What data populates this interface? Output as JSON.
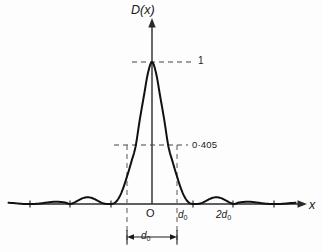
{
  "figure": {
    "background_color": "#fdfdfd",
    "curve_color": "#111111",
    "axis_color": "#2a2a2a",
    "dash_color": "#555555"
  },
  "labels": {
    "y_axis": "D(x)",
    "x_axis": "x",
    "peak_value": "1",
    "half_value": "0·405",
    "origin": "O",
    "tick_d0": "d",
    "tick_d0_sub": "0",
    "tick_2d0": "2d",
    "tick_2d0_sub": "0",
    "width_label": "d",
    "width_label_sub": "0"
  },
  "chart_data": {
    "type": "line",
    "title": "",
    "xlabel": "x",
    "ylabel": "D(x)",
    "xlim": [
      -3.5,
      3.5
    ],
    "ylim": [
      -0.08,
      1.12
    ],
    "grid": false,
    "legend": null,
    "annotations": [
      {
        "text": "1",
        "x": 0.0,
        "y": 1.0,
        "note": "peak amplitude, dashed horizontal leader to the right"
      },
      {
        "text": "0·405",
        "x": 0.0,
        "y": 0.405,
        "note": "half-power style level, dashed horizontal line crossing the main lobe"
      },
      {
        "text": "O",
        "x": 0.0,
        "y": 0.0,
        "note": "origin label below axis"
      },
      {
        "text": "d0",
        "x": 1.0,
        "y": 0.0,
        "note": "first zero tick label"
      },
      {
        "text": "2d0",
        "x": 2.0,
        "y": 0.0,
        "note": "second zero tick label"
      },
      {
        "text": "d0",
        "x": 0.0,
        "y": -0.25,
        "note": "double-headed arrow width measured between the two 0·405 crossings"
      }
    ],
    "x_ticks": [
      -3,
      -2,
      -1,
      0,
      1,
      2,
      3
    ],
    "x_tick_labels": [
      "",
      "",
      "",
      "O",
      "d0",
      "2d0",
      ""
    ],
    "y_ticks": [
      0.405,
      1.0
    ],
    "y_tick_labels": [
      "0·405",
      "1"
    ],
    "x": [
      -3.5,
      -3.4,
      -3.3,
      -3.2,
      -3.1,
      -3.0,
      -2.9,
      -2.8,
      -2.7,
      -2.6,
      -2.5,
      -2.4,
      -2.3,
      -2.2,
      -2.1,
      -2.0,
      -1.9,
      -1.8,
      -1.7,
      -1.6,
      -1.5,
      -1.4,
      -1.3,
      -1.2,
      -1.1,
      -1.0,
      -0.9,
      -0.8,
      -0.7,
      -0.6,
      -0.5,
      -0.4,
      -0.3,
      -0.2,
      -0.1,
      0.0,
      0.1,
      0.2,
      0.3,
      0.4,
      0.5,
      0.6,
      0.7,
      0.8,
      0.9,
      1.0,
      1.1,
      1.2,
      1.3,
      1.4,
      1.5,
      1.6,
      1.7,
      1.8,
      1.9,
      2.0,
      2.1,
      2.2,
      2.3,
      2.4,
      2.5,
      2.6,
      2.7,
      2.8,
      2.9,
      3.0,
      3.1,
      3.2,
      3.3,
      3.4,
      3.5
    ],
    "y": [
      0.0083,
      0.007,
      0.0044,
      0.0016,
      0.0002,
      0.0,
      0.0002,
      0.0017,
      0.0048,
      0.0088,
      0.0127,
      0.0153,
      0.0156,
      0.0133,
      0.009,
      0.0,
      0.0093,
      0.0251,
      0.0395,
      0.047,
      0.045,
      0.0343,
      0.0192,
      0.0061,
      0.0002,
      0.0,
      0.0097,
      0.0468,
      0.1137,
      0.203,
      0.3001,
      0.4053,
      0.5903,
      0.7569,
      0.9207,
      1.0,
      0.9207,
      0.7569,
      0.5903,
      0.4053,
      0.3001,
      0.203,
      0.1137,
      0.0468,
      0.0097,
      0.0,
      0.0002,
      0.0061,
      0.0192,
      0.0343,
      0.045,
      0.047,
      0.0395,
      0.0251,
      0.0093,
      0.0,
      0.009,
      0.0133,
      0.0156,
      0.0153,
      0.0127,
      0.0088,
      0.0048,
      0.0017,
      0.0002,
      0.0,
      0.0002,
      0.0016,
      0.0044,
      0.007,
      0.0083
    ]
  }
}
